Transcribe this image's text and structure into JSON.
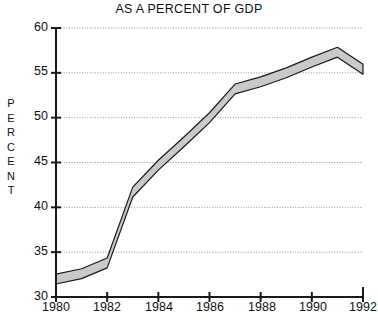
{
  "chart_data": {
    "type": "line",
    "title": "AS A PERCENT OF GDP",
    "xlabel": "YEAR",
    "ylabel": "PERCENT",
    "ylabel_letters": [
      "P",
      "E",
      "R",
      "C",
      "E",
      "N",
      "T"
    ],
    "x": [
      1980,
      1981,
      1982,
      1983,
      1984,
      1985,
      1986,
      1987,
      1988,
      1989,
      1990,
      1991,
      1992
    ],
    "values": [
      32.0,
      32.6,
      33.8,
      41.7,
      44.7,
      47.3,
      50.0,
      53.2,
      54.0,
      55.0,
      56.2,
      57.3,
      55.4
    ],
    "xlim": [
      1980,
      1992
    ],
    "ylim": [
      30,
      60
    ],
    "xticks": [
      1980,
      1982,
      1984,
      1986,
      1988,
      1990,
      1992
    ],
    "xtick_labels": [
      "1980",
      "1982",
      "1984",
      "1986",
      "1988",
      "1990",
      "1992"
    ],
    "yticks": [
      30,
      35,
      40,
      45,
      50,
      55,
      60
    ],
    "ytick_labels": [
      "30",
      "35",
      "40",
      "45",
      "50",
      "55",
      "60"
    ],
    "grid": "horizontal-dotted",
    "legend": null,
    "series_style": {
      "fill": "#c9c9c9",
      "stroke": "#1a1a1a",
      "band_width_units": 0.55
    },
    "axis_color": "#1a1a1a",
    "grid_color": "#8a8a8a",
    "background": "#ffffff"
  }
}
